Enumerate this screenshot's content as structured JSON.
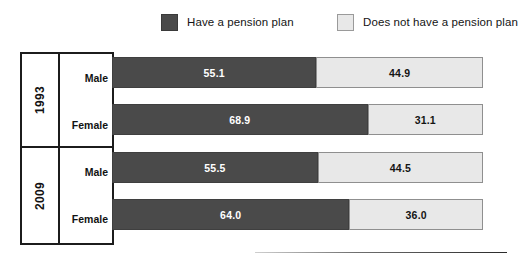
{
  "legend": {
    "items": [
      {
        "label": "Have a pension plan",
        "swatch": "dark",
        "color": "#4a4a4a"
      },
      {
        "label": "Does not have a pension plan",
        "swatch": "light",
        "color": "#e8e8e8"
      }
    ]
  },
  "row_headers": {
    "years": [
      "1993",
      "2009"
    ],
    "genders": [
      "Male",
      "Female"
    ]
  },
  "chart_data": {
    "type": "bar",
    "orientation": "horizontal",
    "stacked": true,
    "stack_total": 100,
    "title": "",
    "xlabel": "",
    "ylabel": "",
    "xlim": [
      0,
      100
    ],
    "grid": false,
    "legend_position": "top",
    "categories": [
      "1993 Male",
      "1993 Female",
      "2009 Male",
      "2009 Female"
    ],
    "groups": [
      {
        "year": "1993",
        "rows": [
          "Male",
          "Female"
        ]
      },
      {
        "year": "2009",
        "rows": [
          "Male",
          "Female"
        ]
      }
    ],
    "series": [
      {
        "name": "Have a pension plan",
        "color": "#4a4a4a",
        "values": [
          55.1,
          68.9,
          55.5,
          64.0
        ]
      },
      {
        "name": "Does not have a pension plan",
        "color": "#e8e8e8",
        "values": [
          44.9,
          31.1,
          44.5,
          36.0
        ]
      }
    ],
    "rows": [
      {
        "year": "1993",
        "gender": "Male",
        "have": "55.1",
        "not_have": "44.9"
      },
      {
        "year": "1993",
        "gender": "Female",
        "have": "68.9",
        "not_have": "31.1"
      },
      {
        "year": "2009",
        "gender": "Male",
        "have": "55.5",
        "not_have": "44.5"
      },
      {
        "year": "2009",
        "gender": "Female",
        "have": "64.0",
        "not_have": "36.0"
      }
    ]
  }
}
